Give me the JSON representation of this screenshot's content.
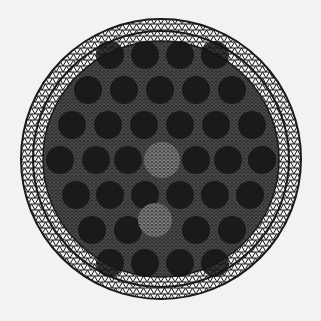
{
  "figure": {
    "type": "triangular-finite-element-mesh",
    "outer_boundary": {
      "cx": 161,
      "cy": 159,
      "r": 140
    },
    "inner_ring_radius": 128,
    "middle_ring_radius": 118,
    "colors": {
      "background": "#f2f2f2",
      "mesh_line": "#1a1a1a",
      "hole_fill": "#141414",
      "dense_region": "#2a2a2a",
      "light_cell": "#7a7a7a"
    },
    "holes": [
      {
        "cx": 110,
        "cy": 55
      },
      {
        "cx": 145,
        "cy": 55
      },
      {
        "cx": 180,
        "cy": 55
      },
      {
        "cx": 215,
        "cy": 55
      },
      {
        "cx": 88,
        "cy": 90
      },
      {
        "cx": 124,
        "cy": 90
      },
      {
        "cx": 160,
        "cy": 90
      },
      {
        "cx": 196,
        "cy": 90
      },
      {
        "cx": 232,
        "cy": 90
      },
      {
        "cx": 72,
        "cy": 125
      },
      {
        "cx": 108,
        "cy": 125
      },
      {
        "cx": 144,
        "cy": 125
      },
      {
        "cx": 180,
        "cy": 125
      },
      {
        "cx": 216,
        "cy": 125
      },
      {
        "cx": 252,
        "cy": 125
      },
      {
        "cx": 60,
        "cy": 160
      },
      {
        "cx": 96,
        "cy": 160
      },
      {
        "cx": 128,
        "cy": 160
      },
      {
        "cx": 196,
        "cy": 160
      },
      {
        "cx": 228,
        "cy": 160
      },
      {
        "cx": 262,
        "cy": 160
      },
      {
        "cx": 76,
        "cy": 195
      },
      {
        "cx": 110,
        "cy": 195
      },
      {
        "cx": 145,
        "cy": 195
      },
      {
        "cx": 180,
        "cy": 195
      },
      {
        "cx": 215,
        "cy": 195
      },
      {
        "cx": 250,
        "cy": 195
      },
      {
        "cx": 92,
        "cy": 230
      },
      {
        "cx": 128,
        "cy": 230
      },
      {
        "cx": 196,
        "cy": 230
      },
      {
        "cx": 232,
        "cy": 230
      },
      {
        "cx": 110,
        "cy": 263
      },
      {
        "cx": 145,
        "cy": 263
      },
      {
        "cx": 180,
        "cy": 263
      },
      {
        "cx": 215,
        "cy": 263
      }
    ],
    "light_regions": [
      {
        "cx": 162,
        "cy": 160,
        "r": 18,
        "label": "center-refined-zone"
      },
      {
        "cx": 155,
        "cy": 220,
        "r": 17,
        "label": "lower-empty-cell"
      }
    ]
  }
}
